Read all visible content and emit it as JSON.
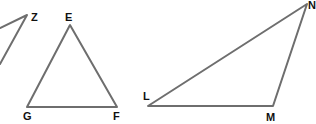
{
  "diagram": {
    "type": "geometry-triangles",
    "stroke_color": "#6e6e6e",
    "label_color": "#111111",
    "triangles": [
      {
        "name": "partial-triangle-Z",
        "vertices": [
          {
            "label": "Z",
            "x": 27,
            "y": 15,
            "label_x": 31,
            "label_y": 21
          },
          {
            "label": "",
            "x": 0,
            "y": 28
          },
          {
            "label": "",
            "x": 0,
            "y": 64
          }
        ]
      },
      {
        "name": "triangle-EGF",
        "vertices": [
          {
            "label": "E",
            "x": 70,
            "y": 25,
            "label_x": 65,
            "label_y": 21
          },
          {
            "label": "G",
            "x": 27,
            "y": 107,
            "label_x": 23,
            "label_y": 120
          },
          {
            "label": "F",
            "x": 117,
            "y": 107,
            "label_x": 113,
            "label_y": 120
          }
        ]
      },
      {
        "name": "triangle-LMN",
        "vertices": [
          {
            "label": "L",
            "x": 148,
            "y": 106,
            "label_x": 143,
            "label_y": 100
          },
          {
            "label": "M",
            "x": 273,
            "y": 106,
            "label_x": 266,
            "label_y": 121
          },
          {
            "label": "N",
            "x": 307,
            "y": 4,
            "label_x": 308,
            "label_y": 9
          }
        ]
      }
    ],
    "labels": {
      "Z": "Z",
      "E": "E",
      "G": "G",
      "F": "F",
      "L": "L",
      "M": "M",
      "N": "N"
    }
  }
}
